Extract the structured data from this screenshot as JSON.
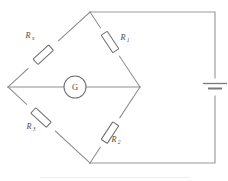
{
  "figure": {
    "background_color": "#ffffff",
    "line_color": "#8d8d8d",
    "width": 228,
    "height": 181
  },
  "components": {
    "resistors": [
      {
        "id": "rx",
        "label_main": "R",
        "label_sub": "x",
        "position": "top-left-arm",
        "description": "unknown resistance on upper left bridge arm"
      },
      {
        "id": "r1",
        "label_main": "R",
        "label_sub": "1",
        "position": "top-right-arm",
        "description": "resistor on upper right bridge arm"
      },
      {
        "id": "r3",
        "label_main": "R",
        "label_sub": "3",
        "position": "bottom-left-arm",
        "description": "resistor on lower left bridge arm"
      },
      {
        "id": "r2",
        "label_main": "R",
        "label_sub": "2",
        "position": "bottom-right-arm",
        "description": "resistor on lower right bridge arm"
      }
    ],
    "galvanometer": {
      "id": "galvanometer",
      "label": "G",
      "description": "galvanometer bridging the middle node"
    },
    "battery": {
      "id": "battery",
      "label": "",
      "description": "cell / battery on right branch"
    }
  },
  "geometry": {
    "diamond": {
      "top": [
        90,
        12
      ],
      "left": [
        8,
        87
      ],
      "right": [
        140,
        87
      ],
      "bottom": [
        90,
        163
      ]
    },
    "outer_loop": {
      "top_right_corner": [
        215,
        12
      ],
      "bottom_right_corner": [
        215,
        163
      ]
    },
    "galvanometer_center": [
      75,
      87
    ],
    "galvanometer_radius": 11,
    "battery_center": [
      215,
      87
    ]
  }
}
